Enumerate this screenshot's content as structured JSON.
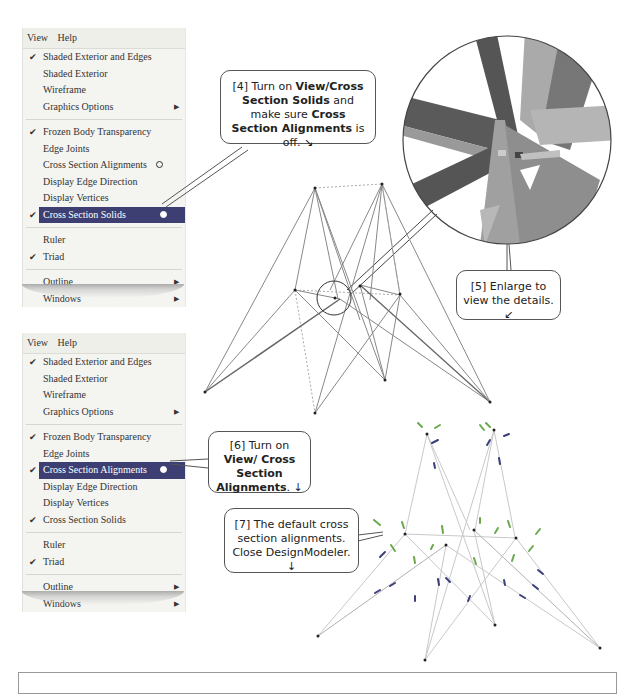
{
  "menu1": {
    "menubar": [
      "View",
      "Help"
    ],
    "items": [
      {
        "label": "Shaded Exterior and Edges",
        "checked": true
      },
      {
        "label": "Shaded Exterior",
        "checked": false
      },
      {
        "label": "Wireframe",
        "checked": false
      },
      {
        "label": "Graphics Options",
        "submenu": true
      },
      {
        "label": "Frozen Body Transparency",
        "checked": true
      },
      {
        "label": "Edge Joints",
        "checked": false
      },
      {
        "label": "Cross Section Alignments",
        "checked": false,
        "radio": "off"
      },
      {
        "label": "Display Edge Direction",
        "checked": false
      },
      {
        "label": "Display Vertices",
        "checked": false
      },
      {
        "label": "Cross Section Solids",
        "checked": true,
        "selected": true,
        "radio": "on"
      },
      {
        "label": "Ruler",
        "checked": false
      },
      {
        "label": "Triad",
        "checked": true
      },
      {
        "label": "Outline",
        "submenu": true
      },
      {
        "label": "Windows",
        "submenu": true
      }
    ]
  },
  "menu2": {
    "menubar": [
      "View",
      "Help"
    ],
    "items": [
      {
        "label": "Shaded Exterior and Edges",
        "checked": true
      },
      {
        "label": "Shaded Exterior",
        "checked": false
      },
      {
        "label": "Wireframe",
        "checked": false
      },
      {
        "label": "Graphics Options",
        "submenu": true
      },
      {
        "label": "Frozen Body Transparency",
        "checked": true
      },
      {
        "label": "Edge Joints",
        "checked": false
      },
      {
        "label": "Cross Section Alignments",
        "checked": true,
        "selected": true,
        "radio": "on"
      },
      {
        "label": "Display Edge Direction",
        "checked": false
      },
      {
        "label": "Display Vertices",
        "checked": false
      },
      {
        "label": "Cross Section Solids",
        "checked": true
      },
      {
        "label": "Ruler",
        "checked": false
      },
      {
        "label": "Triad",
        "checked": true
      },
      {
        "label": "Outline",
        "submenu": true
      },
      {
        "label": "Windows",
        "submenu": true
      }
    ]
  },
  "callouts": {
    "step4": {
      "p1": "[4] Turn on ",
      "b1": "View/Cross Section Solids",
      "p2": " and make sure ",
      "b2": "Cross Section Alignments",
      "p3": " is off. ↘"
    },
    "step5": {
      "text": "[5] Enlarge to view the details. ↙"
    },
    "step6": {
      "p1": "[6] Turn on ",
      "b1": "View/ Cross Section Alignments",
      "p2": ". ↓"
    },
    "step7": {
      "text": "[7] The default cross section alignments. Close DesignModeler. ↓"
    }
  },
  "glyphs": {
    "check": "✔",
    "submenu_arrow": "▶"
  },
  "colors": {
    "selected_bg": "#3d3f72",
    "menu_bg": "#f4f4f0",
    "alignment_green": "#6aa84f",
    "alignment_blue": "#3b3f7a"
  }
}
